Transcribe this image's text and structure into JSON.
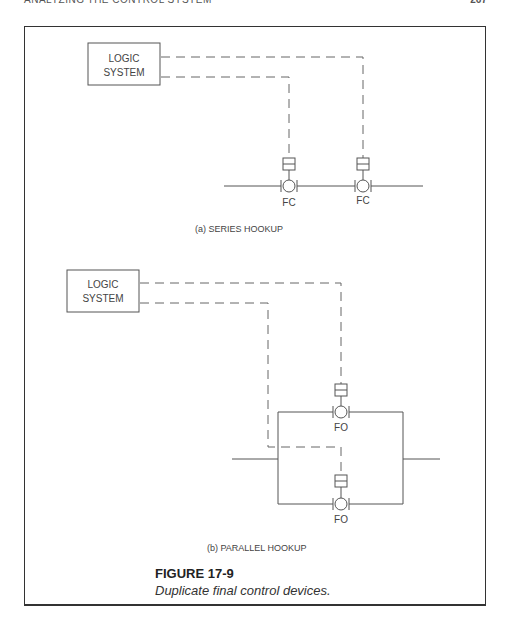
{
  "header": {
    "running_head": "ANALYZING THE CONTROL SYSTEM",
    "page_number": "267"
  },
  "series": {
    "logic_box": {
      "line1": "LOGIC",
      "line2": "SYSTEM"
    },
    "valves": [
      {
        "label": "FC",
        "icon": "valve-with-actuator-icon"
      },
      {
        "label": "FC",
        "icon": "valve-with-actuator-icon"
      }
    ],
    "caption": "(a)  SERIES HOOKUP"
  },
  "parallel": {
    "logic_box": {
      "line1": "LOGIC",
      "line2": "SYSTEM"
    },
    "valves": [
      {
        "label": "FO",
        "icon": "valve-with-actuator-icon"
      },
      {
        "label": "FO",
        "icon": "valve-with-actuator-icon"
      }
    ],
    "caption": "(b)  PARALLEL HOOKUP"
  },
  "figure": {
    "title": "FIGURE 17-9",
    "caption": "Duplicate final control devices."
  }
}
